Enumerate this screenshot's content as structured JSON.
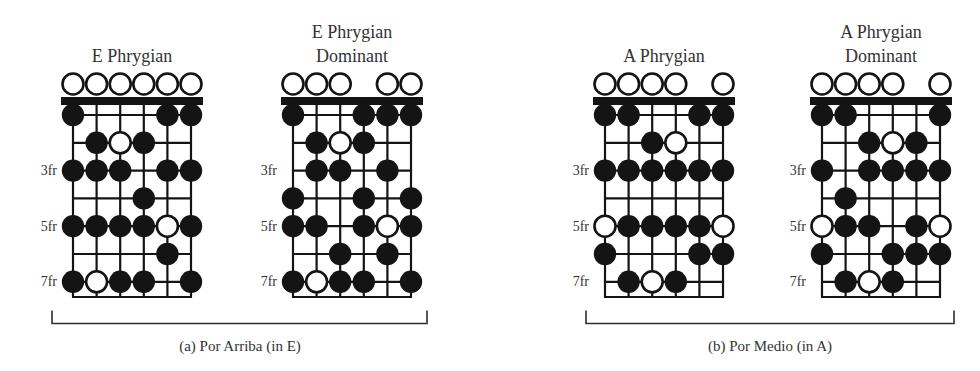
{
  "figure": {
    "background": "#ffffff",
    "ink": "#141414",
    "text_color": "#333333",
    "note_types": {
      "note": "filled black dot (scale tone)",
      "root": "white open dot (root note)",
      "open_strings": "white circles above the nut (open-string scale tones)"
    }
  },
  "diagrams": [
    {
      "id": "e-phrygian",
      "title_line1": "E Phrygian",
      "title_line2": "",
      "num_strings": 6,
      "num_frets_shown": 7,
      "fret_markers": [
        {
          "fret": 3,
          "label": "3fr"
        },
        {
          "fret": 5,
          "label": "5fr"
        },
        {
          "fret": 7,
          "label": "7fr"
        }
      ],
      "open_strings": [
        1,
        2,
        3,
        4,
        5,
        6
      ],
      "notes": [
        {
          "string": 1,
          "fret": 1,
          "type": "note"
        },
        {
          "string": 5,
          "fret": 1,
          "type": "note"
        },
        {
          "string": 6,
          "fret": 1,
          "type": "note"
        },
        {
          "string": 2,
          "fret": 2,
          "type": "note"
        },
        {
          "string": 3,
          "fret": 2,
          "type": "root"
        },
        {
          "string": 4,
          "fret": 2,
          "type": "note"
        },
        {
          "string": 1,
          "fret": 3,
          "type": "note"
        },
        {
          "string": 2,
          "fret": 3,
          "type": "note"
        },
        {
          "string": 3,
          "fret": 3,
          "type": "note"
        },
        {
          "string": 5,
          "fret": 3,
          "type": "note"
        },
        {
          "string": 6,
          "fret": 3,
          "type": "note"
        },
        {
          "string": 4,
          "fret": 4,
          "type": "note"
        },
        {
          "string": 1,
          "fret": 5,
          "type": "note"
        },
        {
          "string": 2,
          "fret": 5,
          "type": "note"
        },
        {
          "string": 3,
          "fret": 5,
          "type": "note"
        },
        {
          "string": 4,
          "fret": 5,
          "type": "note"
        },
        {
          "string": 5,
          "fret": 5,
          "type": "root"
        },
        {
          "string": 6,
          "fret": 5,
          "type": "note"
        },
        {
          "string": 5,
          "fret": 6,
          "type": "note"
        },
        {
          "string": 1,
          "fret": 7,
          "type": "note"
        },
        {
          "string": 2,
          "fret": 7,
          "type": "root"
        },
        {
          "string": 3,
          "fret": 7,
          "type": "note"
        },
        {
          "string": 4,
          "fret": 7,
          "type": "note"
        },
        {
          "string": 6,
          "fret": 7,
          "type": "note"
        }
      ]
    },
    {
      "id": "e-phrygian-dominant",
      "title_line1": "E Phrygian",
      "title_line2": "Dominant",
      "num_strings": 6,
      "num_frets_shown": 7,
      "fret_markers": [
        {
          "fret": 3,
          "label": "3fr"
        },
        {
          "fret": 5,
          "label": "5fr"
        },
        {
          "fret": 7,
          "label": "7fr"
        }
      ],
      "open_strings": [
        1,
        2,
        3,
        5,
        6
      ],
      "notes": [
        {
          "string": 1,
          "fret": 1,
          "type": "note"
        },
        {
          "string": 4,
          "fret": 1,
          "type": "note"
        },
        {
          "string": 5,
          "fret": 1,
          "type": "note"
        },
        {
          "string": 6,
          "fret": 1,
          "type": "note"
        },
        {
          "string": 2,
          "fret": 2,
          "type": "note"
        },
        {
          "string": 3,
          "fret": 2,
          "type": "root"
        },
        {
          "string": 4,
          "fret": 2,
          "type": "note"
        },
        {
          "string": 2,
          "fret": 3,
          "type": "note"
        },
        {
          "string": 3,
          "fret": 3,
          "type": "note"
        },
        {
          "string": 5,
          "fret": 3,
          "type": "note"
        },
        {
          "string": 1,
          "fret": 4,
          "type": "note"
        },
        {
          "string": 4,
          "fret": 4,
          "type": "note"
        },
        {
          "string": 6,
          "fret": 4,
          "type": "note"
        },
        {
          "string": 1,
          "fret": 5,
          "type": "note"
        },
        {
          "string": 2,
          "fret": 5,
          "type": "note"
        },
        {
          "string": 4,
          "fret": 5,
          "type": "note"
        },
        {
          "string": 5,
          "fret": 5,
          "type": "root"
        },
        {
          "string": 6,
          "fret": 5,
          "type": "note"
        },
        {
          "string": 3,
          "fret": 6,
          "type": "note"
        },
        {
          "string": 5,
          "fret": 6,
          "type": "note"
        },
        {
          "string": 1,
          "fret": 7,
          "type": "note"
        },
        {
          "string": 2,
          "fret": 7,
          "type": "root"
        },
        {
          "string": 3,
          "fret": 7,
          "type": "note"
        },
        {
          "string": 4,
          "fret": 7,
          "type": "note"
        },
        {
          "string": 6,
          "fret": 7,
          "type": "note"
        }
      ]
    },
    {
      "id": "a-phrygian",
      "title_line1": "A Phrygian",
      "title_line2": "",
      "num_strings": 6,
      "num_frets_shown": 7,
      "fret_markers": [
        {
          "fret": 3,
          "label": "3fr"
        },
        {
          "fret": 5,
          "label": "5fr"
        },
        {
          "fret": 7,
          "label": "7fr"
        }
      ],
      "open_strings": [
        1,
        2,
        3,
        4,
        6
      ],
      "notes": [
        {
          "string": 1,
          "fret": 1,
          "type": "note"
        },
        {
          "string": 2,
          "fret": 1,
          "type": "note"
        },
        {
          "string": 5,
          "fret": 1,
          "type": "note"
        },
        {
          "string": 6,
          "fret": 1,
          "type": "note"
        },
        {
          "string": 3,
          "fret": 2,
          "type": "note"
        },
        {
          "string": 4,
          "fret": 2,
          "type": "root"
        },
        {
          "string": 1,
          "fret": 3,
          "type": "note"
        },
        {
          "string": 2,
          "fret": 3,
          "type": "note"
        },
        {
          "string": 3,
          "fret": 3,
          "type": "note"
        },
        {
          "string": 4,
          "fret": 3,
          "type": "note"
        },
        {
          "string": 5,
          "fret": 3,
          "type": "note"
        },
        {
          "string": 6,
          "fret": 3,
          "type": "note"
        },
        {
          "string": 1,
          "fret": 5,
          "type": "root"
        },
        {
          "string": 2,
          "fret": 5,
          "type": "note"
        },
        {
          "string": 3,
          "fret": 5,
          "type": "note"
        },
        {
          "string": 4,
          "fret": 5,
          "type": "note"
        },
        {
          "string": 5,
          "fret": 5,
          "type": "note"
        },
        {
          "string": 6,
          "fret": 5,
          "type": "root"
        },
        {
          "string": 1,
          "fret": 6,
          "type": "note"
        },
        {
          "string": 5,
          "fret": 6,
          "type": "note"
        },
        {
          "string": 6,
          "fret": 6,
          "type": "note"
        },
        {
          "string": 2,
          "fret": 7,
          "type": "note"
        },
        {
          "string": 3,
          "fret": 7,
          "type": "root"
        },
        {
          "string": 4,
          "fret": 7,
          "type": "note"
        }
      ]
    },
    {
      "id": "a-phrygian-dominant",
      "title_line1": "A Phrygian",
      "title_line2": "Dominant",
      "num_strings": 6,
      "num_frets_shown": 7,
      "fret_markers": [
        {
          "fret": 3,
          "label": "3fr"
        },
        {
          "fret": 5,
          "label": "5fr"
        },
        {
          "fret": 7,
          "label": "7fr"
        }
      ],
      "open_strings": [
        1,
        2,
        3,
        4,
        6
      ],
      "notes": [
        {
          "string": 1,
          "fret": 1,
          "type": "note"
        },
        {
          "string": 2,
          "fret": 1,
          "type": "note"
        },
        {
          "string": 6,
          "fret": 1,
          "type": "note"
        },
        {
          "string": 3,
          "fret": 2,
          "type": "note"
        },
        {
          "string": 4,
          "fret": 2,
          "type": "root"
        },
        {
          "string": 5,
          "fret": 2,
          "type": "note"
        },
        {
          "string": 1,
          "fret": 3,
          "type": "note"
        },
        {
          "string": 3,
          "fret": 3,
          "type": "note"
        },
        {
          "string": 4,
          "fret": 3,
          "type": "note"
        },
        {
          "string": 5,
          "fret": 3,
          "type": "note"
        },
        {
          "string": 6,
          "fret": 3,
          "type": "note"
        },
        {
          "string": 2,
          "fret": 4,
          "type": "note"
        },
        {
          "string": 1,
          "fret": 5,
          "type": "root"
        },
        {
          "string": 2,
          "fret": 5,
          "type": "note"
        },
        {
          "string": 3,
          "fret": 5,
          "type": "note"
        },
        {
          "string": 5,
          "fret": 5,
          "type": "note"
        },
        {
          "string": 6,
          "fret": 5,
          "type": "root"
        },
        {
          "string": 1,
          "fret": 6,
          "type": "note"
        },
        {
          "string": 4,
          "fret": 6,
          "type": "note"
        },
        {
          "string": 5,
          "fret": 6,
          "type": "note"
        },
        {
          "string": 6,
          "fret": 6,
          "type": "note"
        },
        {
          "string": 2,
          "fret": 7,
          "type": "note"
        },
        {
          "string": 3,
          "fret": 7,
          "type": "root"
        },
        {
          "string": 4,
          "fret": 7,
          "type": "note"
        }
      ]
    }
  ],
  "groups": [
    {
      "id": "a",
      "caption": "(a) Por Arriba (in E)"
    },
    {
      "id": "b",
      "caption": "(b) Por Medio (in A)"
    }
  ]
}
